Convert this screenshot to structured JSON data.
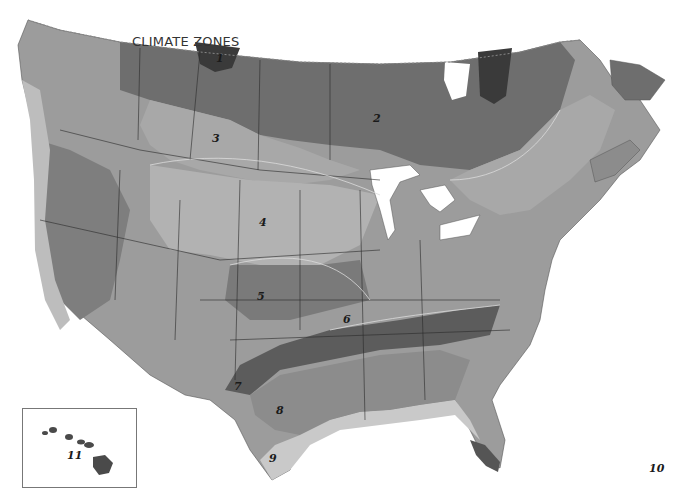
{
  "title": "CLIMATE ZONES",
  "zones": [
    {
      "id": "1",
      "label": "1",
      "x": 216,
      "y": 52,
      "fill": "#3a3a3a"
    },
    {
      "id": "2",
      "label": "2",
      "x": 373,
      "y": 112,
      "fill": "#6e6e6e"
    },
    {
      "id": "3",
      "label": "3",
      "x": 212,
      "y": 132,
      "fill": "#a8a8a8"
    },
    {
      "id": "4",
      "label": "4",
      "x": 259,
      "y": 216,
      "fill": "#b2b2b2"
    },
    {
      "id": "5",
      "label": "5",
      "x": 257,
      "y": 290,
      "fill": "#7a7a7a"
    },
    {
      "id": "6",
      "label": "6",
      "x": 343,
      "y": 313,
      "fill": "#9c9c9c"
    },
    {
      "id": "7",
      "label": "7",
      "x": 234,
      "y": 380,
      "fill": "#5c5c5c"
    },
    {
      "id": "8",
      "label": "8",
      "x": 276,
      "y": 404,
      "fill": "#8c8c8c"
    },
    {
      "id": "9",
      "label": "9",
      "x": 269,
      "y": 452,
      "fill": "#c9c9c9"
    },
    {
      "id": "10",
      "label": "10",
      "x": 649,
      "y": 462,
      "fill": "#555555"
    },
    {
      "id": "11",
      "label": "11",
      "x": 66,
      "y": 448,
      "fill": "#4a4a4a"
    }
  ],
  "inset": {
    "name": "Hawaii",
    "zone": "11"
  },
  "colors": {
    "water": "#ffffff",
    "border": "#2a2a2a",
    "contour": "#d8d8d8"
  }
}
